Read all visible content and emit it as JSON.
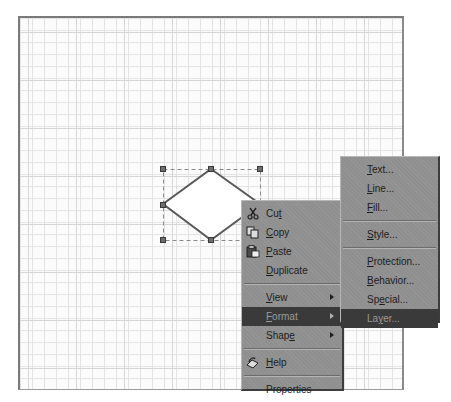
{
  "canvas": {
    "grid_minor_px": 12,
    "grid_major_px": 48,
    "background": "#fbfbfb"
  },
  "shape": {
    "type": "diamond",
    "selected": true,
    "fill": "#ffffff",
    "stroke": "#555555"
  },
  "context_menu": {
    "items": [
      {
        "label": "Cut",
        "mnemonic": "t",
        "icon": "scissors-icon"
      },
      {
        "label": "Copy",
        "mnemonic": "C",
        "icon": "copy-icon"
      },
      {
        "label": "Paste",
        "mnemonic": "P",
        "icon": "paste-icon"
      },
      {
        "label": "Duplicate",
        "mnemonic": "D"
      },
      {
        "label": "View",
        "mnemonic": "V",
        "submenu": true
      },
      {
        "label": "Format",
        "mnemonic": "F",
        "submenu": true,
        "selected": true
      },
      {
        "label": "Shape",
        "mnemonic": "e",
        "submenu": true
      },
      {
        "label": "Help",
        "mnemonic": "H",
        "icon": "help-icon"
      },
      {
        "label": "Properties"
      }
    ]
  },
  "format_submenu": {
    "items": [
      {
        "label": "Text...",
        "mnemonic": "T"
      },
      {
        "label": "Line...",
        "mnemonic": "L"
      },
      {
        "label": "Fill...",
        "mnemonic": "F"
      },
      {
        "label": "Style...",
        "mnemonic": "S"
      },
      {
        "label": "Protection...",
        "mnemonic": "P"
      },
      {
        "label": "Behavior...",
        "mnemonic": "B"
      },
      {
        "label": "Special...",
        "mnemonic": "e"
      },
      {
        "label": "Layer...",
        "mnemonic": "y",
        "selected": true
      }
    ]
  },
  "colors": {
    "menu_bg": "#8f8f8f",
    "highlight_bg": "#3a3a3a",
    "highlight_text": "#9a9a9a",
    "text": "#1c1c1c"
  }
}
